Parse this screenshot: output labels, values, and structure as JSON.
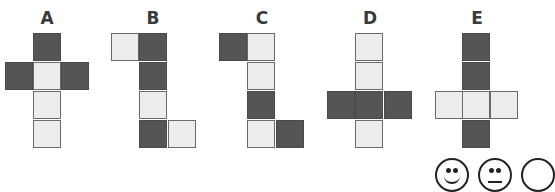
{
  "nets": [
    {
      "label": "A",
      "label_x": 47,
      "cells": [
        {
          "x": 33,
          "y": 33,
          "shade": "dark"
        },
        {
          "x": 5,
          "y": 62,
          "shade": "dark"
        },
        {
          "x": 33,
          "y": 62,
          "shade": "light"
        },
        {
          "x": 61,
          "y": 62,
          "shade": "dark"
        },
        {
          "x": 33,
          "y": 91,
          "shade": "light"
        },
        {
          "x": 33,
          "y": 120,
          "shade": "light"
        }
      ]
    },
    {
      "label": "B",
      "label_x": 153,
      "cells": [
        {
          "x": 111,
          "y": 33,
          "shade": "light"
        },
        {
          "x": 139,
          "y": 33,
          "shade": "dark"
        },
        {
          "x": 139,
          "y": 62,
          "shade": "dark"
        },
        {
          "x": 139,
          "y": 91,
          "shade": "light"
        },
        {
          "x": 139,
          "y": 120,
          "shade": "dark"
        },
        {
          "x": 168,
          "y": 120,
          "shade": "light"
        }
      ]
    },
    {
      "label": "C",
      "label_x": 262,
      "cells": [
        {
          "x": 219,
          "y": 33,
          "shade": "dark"
        },
        {
          "x": 247,
          "y": 33,
          "shade": "light"
        },
        {
          "x": 247,
          "y": 62,
          "shade": "light"
        },
        {
          "x": 247,
          "y": 91,
          "shade": "dark"
        },
        {
          "x": 247,
          "y": 120,
          "shade": "light"
        },
        {
          "x": 276,
          "y": 120,
          "shade": "dark"
        }
      ]
    },
    {
      "label": "D",
      "label_x": 370,
      "cells": [
        {
          "x": 355,
          "y": 33,
          "shade": "light"
        },
        {
          "x": 355,
          "y": 62,
          "shade": "light"
        },
        {
          "x": 327,
          "y": 91,
          "shade": "dark"
        },
        {
          "x": 355,
          "y": 91,
          "shade": "dark"
        },
        {
          "x": 384,
          "y": 91,
          "shade": "dark"
        },
        {
          "x": 355,
          "y": 120,
          "shade": "light"
        }
      ]
    },
    {
      "label": "E",
      "label_x": 477,
      "cells": [
        {
          "x": 462,
          "y": 33,
          "shade": "dark"
        },
        {
          "x": 462,
          "y": 62,
          "shade": "dark"
        },
        {
          "x": 435,
          "y": 91,
          "shade": "light"
        },
        {
          "x": 462,
          "y": 91,
          "shade": "light"
        },
        {
          "x": 490,
          "y": 91,
          "shade": "light"
        },
        {
          "x": 462,
          "y": 120,
          "shade": "dark"
        }
      ]
    }
  ],
  "faces": [
    {
      "type": "happy",
      "x": 435
    },
    {
      "type": "neutral",
      "x": 478
    },
    {
      "type": "partial",
      "x": 521
    }
  ]
}
